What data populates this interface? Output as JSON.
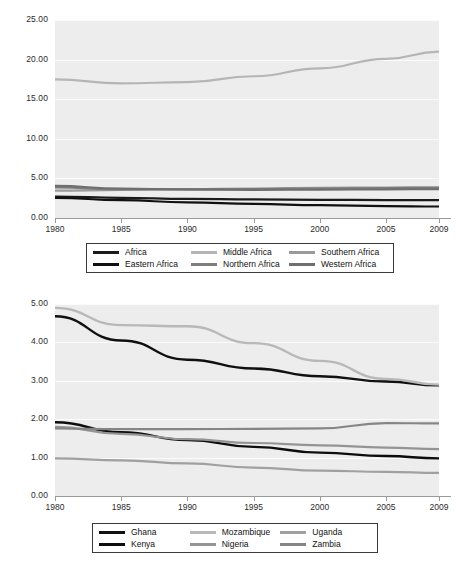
{
  "page": {
    "background": "#ffffff",
    "plot_background": "#ededed",
    "gridline_color": "#fbfbfb",
    "axis_color": "#9a9a9a",
    "text_color": "#2b2b2b"
  },
  "chart_data": [
    {
      "id": "africa-regions",
      "type": "line",
      "title": "",
      "subtitle": "",
      "xlabel": "",
      "ylabel": "",
      "grid": true,
      "legend_position": "bottom",
      "x": [
        1980,
        1985,
        1990,
        1995,
        2000,
        2005,
        2009
      ],
      "xtick_labels": [
        "1980",
        "1985",
        "1990",
        "1995",
        "2000",
        "2005",
        "2009"
      ],
      "ytick_labels": [
        "25.00",
        "20.00",
        "15.00",
        "10.00",
        "5.00",
        "0.00"
      ],
      "ytick_values": [
        25,
        20,
        15,
        10,
        5,
        0
      ],
      "ylim": [
        0,
        25
      ],
      "xlim": [
        1980,
        2009
      ],
      "series": [
        {
          "name": "Africa",
          "color": "#1a1a1a",
          "width": 2.2,
          "values": [
            2.7,
            2.55,
            2.42,
            2.35,
            2.3,
            2.26,
            2.25
          ]
        },
        {
          "name": "Middle Africa",
          "color": "#b5b5b5",
          "width": 2.2,
          "values": [
            17.5,
            17.0,
            17.15,
            17.9,
            18.9,
            20.1,
            21.0
          ]
        },
        {
          "name": "Southern Africa",
          "color": "#9a9a9a",
          "width": 2.2,
          "values": [
            3.45,
            3.55,
            3.65,
            3.72,
            3.8,
            3.85,
            3.88
          ]
        },
        {
          "name": "Eastern Africa",
          "color": "#101010",
          "width": 2.2,
          "values": [
            2.55,
            2.25,
            1.98,
            1.78,
            1.62,
            1.5,
            1.45
          ]
        },
        {
          "name": "Northern Africa",
          "color": "#7d7d7d",
          "width": 2.2,
          "values": [
            3.85,
            3.62,
            3.62,
            3.66,
            3.72,
            3.78,
            3.82
          ]
        },
        {
          "name": "Western Africa",
          "color": "#6f6f6f",
          "width": 2.2,
          "values": [
            4.05,
            3.72,
            3.6,
            3.56,
            3.58,
            3.62,
            3.65
          ]
        }
      ],
      "legend": [
        {
          "label": "Africa",
          "color": "#1a1a1a"
        },
        {
          "label": "Middle Africa",
          "color": "#b5b5b5"
        },
        {
          "label": "Southern Africa",
          "color": "#9a9a9a"
        },
        {
          "label": "Eastern Africa",
          "color": "#101010"
        },
        {
          "label": "Northern Africa",
          "color": "#7d7d7d"
        },
        {
          "label": "Western Africa",
          "color": "#6f6f6f"
        }
      ]
    },
    {
      "id": "african-countries",
      "type": "line",
      "title": "",
      "subtitle": "",
      "xlabel": "",
      "ylabel": "",
      "grid": true,
      "legend_position": "bottom",
      "x": [
        1980,
        1985,
        1990,
        1995,
        2000,
        2005,
        2009
      ],
      "xtick_labels": [
        "1980",
        "1985",
        "1990",
        "1995",
        "2000",
        "2005",
        "2009"
      ],
      "ytick_labels": [
        "5.00",
        "4.00",
        "3.00",
        "2.00",
        "1.00",
        "0.00"
      ],
      "ytick_values": [
        5,
        4,
        3,
        2,
        1,
        0
      ],
      "ylim": [
        0,
        5
      ],
      "xlim": [
        1980,
        2009
      ],
      "series": [
        {
          "name": "Ghana",
          "color": "#101010",
          "width": 2.4,
          "values": [
            4.68,
            4.05,
            3.55,
            3.32,
            3.12,
            2.98,
            2.88
          ]
        },
        {
          "name": "Mozambique",
          "color": "#b8b8b8",
          "width": 2.4,
          "values": [
            4.9,
            4.45,
            4.42,
            3.98,
            3.52,
            3.05,
            2.9
          ]
        },
        {
          "name": "Uganda",
          "color": "#a0a0a0",
          "width": 2.2,
          "values": [
            0.98,
            0.93,
            0.85,
            0.74,
            0.66,
            0.63,
            0.6
          ]
        },
        {
          "name": "Kenya",
          "color": "#0d0d0d",
          "width": 2.4,
          "values": [
            1.92,
            1.66,
            1.46,
            1.28,
            1.13,
            1.04,
            0.98
          ]
        },
        {
          "name": "Nigeria",
          "color": "#949494",
          "width": 2.2,
          "values": [
            1.8,
            1.62,
            1.48,
            1.38,
            1.32,
            1.26,
            1.22
          ]
        },
        {
          "name": "Zambia",
          "color": "#858585",
          "width": 2.2,
          "values": [
            1.76,
            1.74,
            1.74,
            1.75,
            1.76,
            1.9,
            1.89
          ]
        }
      ],
      "legend": [
        {
          "label": "Ghana",
          "color": "#101010"
        },
        {
          "label": "Mozambique",
          "color": "#b8b8b8"
        },
        {
          "label": "Uganda",
          "color": "#a0a0a0"
        },
        {
          "label": "Kenya",
          "color": "#0d0d0d"
        },
        {
          "label": "Nigeria",
          "color": "#949494"
        },
        {
          "label": "Zambia",
          "color": "#858585"
        }
      ]
    }
  ]
}
